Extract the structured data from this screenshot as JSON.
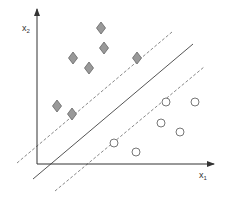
{
  "diagram": {
    "axes": {
      "x_label": "x",
      "x_label_sub": "1",
      "y_label": "x",
      "y_label_sub": "2",
      "origin": [
        37,
        164
      ],
      "x_end": [
        214,
        164
      ],
      "y_end": [
        37,
        9
      ]
    },
    "colors": {
      "axis": "#333333",
      "line": "#555555",
      "dashed": "#888888",
      "diamond_fill": "#999999",
      "diamond_stroke": "#666666",
      "circle_stroke": "#666666"
    },
    "lines": {
      "hyperplane": {
        "from": [
          33,
          179
        ],
        "to": [
          193,
          44
        ],
        "style": "solid"
      },
      "margin_upper": {
        "from": [
          17,
          163
        ],
        "to": [
          172,
          32
        ],
        "style": "dashed"
      },
      "margin_lower": {
        "from": [
          55,
          191
        ],
        "to": [
          204,
          67
        ],
        "style": "dashed"
      }
    },
    "class_diamond": {
      "name": "class A (diamonds)",
      "points": [
        [
          101,
          28
        ],
        [
          104,
          48
        ],
        [
          73,
          58
        ],
        [
          89,
          68
        ],
        [
          137,
          58
        ],
        [
          57,
          106
        ],
        [
          72,
          114
        ]
      ]
    },
    "class_circle": {
      "name": "class B (circles)",
      "points": [
        [
          166,
          102
        ],
        [
          195,
          102
        ],
        [
          161,
          123
        ],
        [
          180,
          132
        ],
        [
          114,
          143
        ],
        [
          136,
          152
        ]
      ]
    }
  }
}
